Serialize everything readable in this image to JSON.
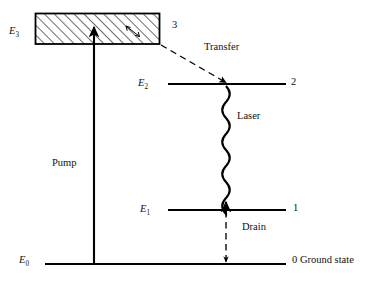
{
  "figure": {
    "kind": "energy-level-diagram",
    "stroke_color": "#000000",
    "background_color": "#ffffff",
    "levels": [
      {
        "id": "E3",
        "energy_label": "E",
        "energy_sub": "3",
        "number_label": "3",
        "style": "hatched-band"
      },
      {
        "id": "E2",
        "energy_label": "E",
        "energy_sub": "2",
        "number_label": "2",
        "style": "solid-line"
      },
      {
        "id": "E1",
        "energy_label": "E",
        "energy_sub": "1",
        "number_label": "1",
        "style": "solid-line"
      },
      {
        "id": "E0",
        "energy_label": "E",
        "energy_sub": "0",
        "number_label": "0 Ground state",
        "style": "solid-line"
      }
    ],
    "transitions": [
      {
        "name": "Pump",
        "label": "Pump",
        "line": "solid",
        "direction": "up",
        "from": "E0",
        "to": "E3"
      },
      {
        "name": "Transfer",
        "label": "Transfer",
        "line": "dashed",
        "direction": "diagonal-down",
        "from": "E3",
        "to": "E2"
      },
      {
        "name": "Laser",
        "label": "Laser",
        "line": "wavy",
        "direction": "down",
        "from": "E2",
        "to": "E1"
      },
      {
        "name": "Drain",
        "label": "Drain",
        "line": "dashed",
        "direction": "down",
        "from": "E1",
        "to": "E0"
      }
    ]
  },
  "labels": {
    "e3": "E",
    "e3_sub": "3",
    "e2": "E",
    "e2_sub": "2",
    "e1": "E",
    "e1_sub": "1",
    "e0": "E",
    "e0_sub": "0",
    "n3": "3",
    "n2": "2",
    "n1": "1",
    "n0": "0 Ground state",
    "transfer": "Transfer",
    "laser": "Laser",
    "pump": "Pump",
    "drain": "Drain"
  }
}
